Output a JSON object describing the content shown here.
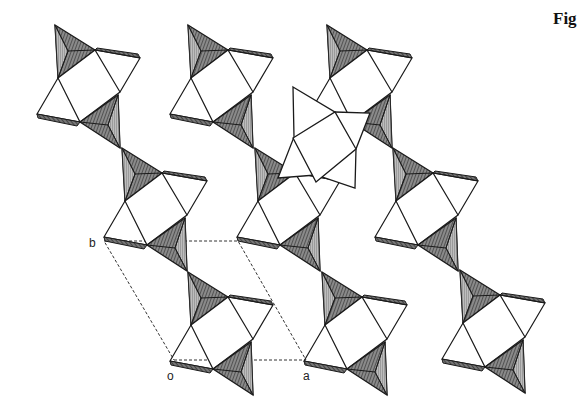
{
  "figure": {
    "caption": "Fig",
    "colors": {
      "line": "#1a1a1a",
      "tetra_fill": "#6e6e6e",
      "tetra_face_light": "#b9b9b9",
      "tetra_face_dark": "#4a4a4a",
      "background": "#ffffff",
      "cell_dash": "#333333"
    },
    "unit_cell": {
      "labels": {
        "origin": "o",
        "a_axis": "a",
        "b_axis": "b"
      },
      "vertices": [
        [
          174,
          360
        ],
        [
          306,
          360
        ],
        [
          238,
          241
        ],
        [
          104,
          241
        ]
      ]
    },
    "chains": [
      {
        "name": "column-1",
        "units": [
          [
            55,
            25
          ],
          [
            122,
            148
          ],
          [
            188,
            272
          ]
        ]
      },
      {
        "name": "column-2",
        "units": [
          [
            188,
            25
          ],
          [
            255,
            148
          ],
          [
            322,
            272
          ]
        ]
      },
      {
        "name": "column-3",
        "units": [
          [
            327,
            25
          ],
          [
            393,
            148
          ],
          [
            460,
            270
          ]
        ]
      }
    ],
    "highlighted_star": {
      "outer": [
        [
          293,
          87
        ],
        [
          335,
          112
        ],
        [
          370,
          113
        ],
        [
          356,
          149
        ],
        [
          355,
          188
        ],
        [
          316,
          175
        ],
        [
          278,
          178
        ],
        [
          294,
          137
        ]
      ],
      "inner_square": [
        [
          293,
          138
        ],
        [
          335,
          112
        ],
        [
          356,
          149
        ],
        [
          316,
          182
        ]
      ]
    }
  }
}
